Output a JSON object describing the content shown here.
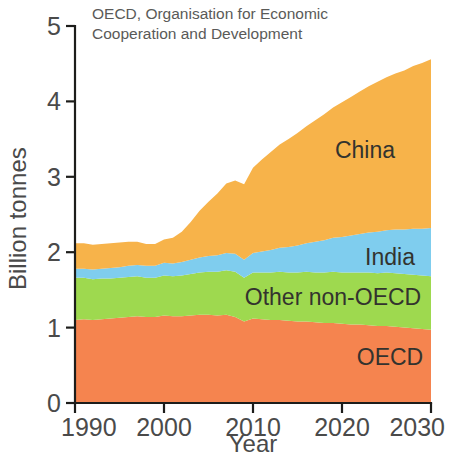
{
  "caption": {
    "line1": "OECD, Organisation for Economic",
    "line2": "Cooperation and Development"
  },
  "axes": {
    "x_title": "Year",
    "y_title": "Billion tonnes",
    "x_ticks": [
      "1990",
      "2000",
      "2010",
      "2020",
      "2030"
    ],
    "y_ticks": [
      "0",
      "1",
      "2",
      "3",
      "4",
      "5"
    ]
  },
  "labels": {
    "china": "China",
    "india": "India",
    "other_non_oecd": "Other non-OECD",
    "oecd": "OECD"
  },
  "colors": {
    "china": "#F5B košu",
    "china_hex": "#F7B34A",
    "india_hex": "#7FCDEE",
    "other_hex": "#9ED94F",
    "oecd_hex": "#F5844F",
    "axis_hex": "#1d1d1b"
  },
  "chart_data": {
    "type": "area",
    "title": "",
    "subtitle": "OECD, Organisation for Economic Cooperation and Development",
    "xlabel": "Year",
    "ylabel": "Billion tonnes",
    "xlim": [
      1990,
      2030
    ],
    "ylim": [
      0,
      5
    ],
    "xticks": [
      1990,
      2000,
      2010,
      2020,
      2030
    ],
    "yticks": [
      0,
      1,
      2,
      3,
      4,
      5
    ],
    "grid": false,
    "legend": "inline-labels",
    "stacked": true,
    "stack_order_bottom_to_top": [
      "OECD",
      "Other non-OECD",
      "India",
      "China"
    ],
    "x": [
      1990,
      1991,
      1992,
      1993,
      1994,
      1995,
      1996,
      1997,
      1998,
      1999,
      2000,
      2001,
      2002,
      2003,
      2004,
      2005,
      2006,
      2007,
      2008,
      2009,
      2010,
      2011,
      2012,
      2013,
      2014,
      2015,
      2016,
      2017,
      2018,
      2019,
      2020,
      2021,
      2022,
      2023,
      2024,
      2025,
      2026,
      2027,
      2028,
      2029,
      2030
    ],
    "series": [
      {
        "name": "OECD",
        "color": "#F5844F",
        "values": [
          1.1,
          1.11,
          1.1,
          1.11,
          1.12,
          1.13,
          1.14,
          1.15,
          1.14,
          1.14,
          1.16,
          1.15,
          1.15,
          1.16,
          1.17,
          1.17,
          1.16,
          1.17,
          1.14,
          1.08,
          1.12,
          1.11,
          1.1,
          1.1,
          1.09,
          1.08,
          1.08,
          1.07,
          1.06,
          1.06,
          1.05,
          1.04,
          1.04,
          1.03,
          1.02,
          1.02,
          1.01,
          1.0,
          0.99,
          0.98,
          0.97
        ]
      },
      {
        "name": "Other non-OECD",
        "color": "#9ED94F",
        "values": [
          0.56,
          0.55,
          0.54,
          0.54,
          0.53,
          0.53,
          0.53,
          0.53,
          0.52,
          0.52,
          0.53,
          0.53,
          0.54,
          0.55,
          0.56,
          0.57,
          0.58,
          0.59,
          0.6,
          0.58,
          0.61,
          0.62,
          0.63,
          0.64,
          0.64,
          0.65,
          0.66,
          0.66,
          0.67,
          0.68,
          0.68,
          0.69,
          0.69,
          0.7,
          0.7,
          0.71,
          0.71,
          0.71,
          0.71,
          0.71,
          0.71
        ]
      },
      {
        "name": "India",
        "color": "#7FCDEE",
        "values": [
          0.12,
          0.12,
          0.13,
          0.13,
          0.14,
          0.14,
          0.15,
          0.15,
          0.16,
          0.16,
          0.17,
          0.17,
          0.18,
          0.19,
          0.2,
          0.21,
          0.22,
          0.23,
          0.24,
          0.24,
          0.26,
          0.28,
          0.3,
          0.32,
          0.34,
          0.36,
          0.38,
          0.41,
          0.43,
          0.45,
          0.47,
          0.49,
          0.51,
          0.53,
          0.55,
          0.56,
          0.58,
          0.59,
          0.61,
          0.62,
          0.64
        ]
      },
      {
        "name": "China",
        "color": "#F7B34A",
        "values": [
          0.34,
          0.34,
          0.33,
          0.33,
          0.33,
          0.33,
          0.32,
          0.31,
          0.29,
          0.29,
          0.31,
          0.34,
          0.4,
          0.5,
          0.62,
          0.72,
          0.82,
          0.92,
          0.97,
          1.0,
          1.13,
          1.22,
          1.3,
          1.37,
          1.43,
          1.49,
          1.55,
          1.61,
          1.67,
          1.73,
          1.79,
          1.84,
          1.89,
          1.94,
          1.99,
          2.03,
          2.07,
          2.11,
          2.16,
          2.2,
          2.24
        ]
      }
    ],
    "stacked_totals_note": "Top of stack rises from about 2.12 in 1990 to about 4.68 in 2030"
  }
}
